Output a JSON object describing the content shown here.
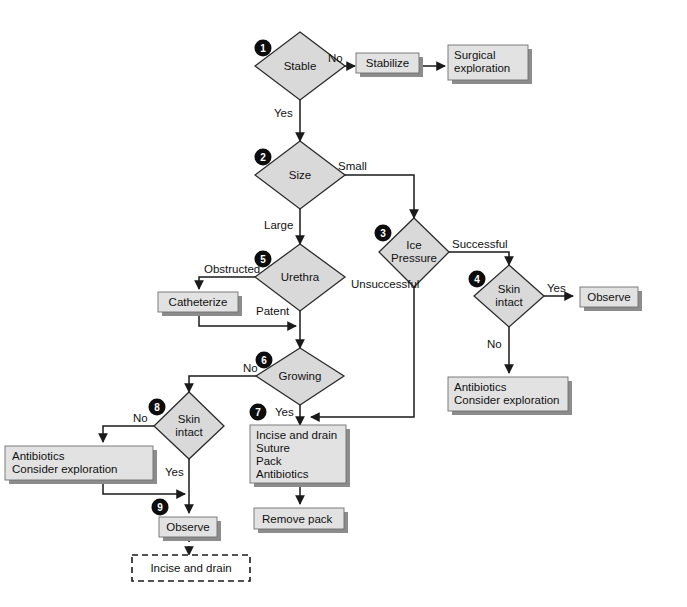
{
  "diagram": {
    "type": "flowchart",
    "palette": {
      "diamond_fill": "#d9d9d9",
      "box_fill": "#e2e2e2",
      "shadow": "#8c8c8c",
      "stroke": "#1a1a1a",
      "badge_fill": "#0d0d0d",
      "badge_text": "#ffffff",
      "background": "#ffffff"
    },
    "nodes": {
      "d1": {
        "label_line1": "Stable",
        "label_line2": "",
        "step": "1",
        "shape": "diamond"
      },
      "d2": {
        "label_line1": "Size",
        "label_line2": "",
        "step": "2",
        "shape": "diamond"
      },
      "d3": {
        "label_line1": "Ice",
        "label_line2": "Pressure",
        "step": "3",
        "shape": "diamond"
      },
      "d4": {
        "label_line1": "Skin",
        "label_line2": "intact",
        "step": "4",
        "shape": "diamond"
      },
      "d5": {
        "label_line1": "Urethra",
        "label_line2": "",
        "step": "5",
        "shape": "diamond"
      },
      "d6": {
        "label_line1": "Growing",
        "label_line2": "",
        "step": "6",
        "shape": "diamond"
      },
      "d8": {
        "label_line1": "Skin",
        "label_line2": "intact",
        "step": "8",
        "shape": "diamond"
      },
      "b_stabilize": {
        "label_line1": "Stabilize",
        "shape": "box"
      },
      "b_surgical": {
        "label_line1": "Surgical",
        "label_line2": "exploration",
        "shape": "box"
      },
      "b_observe_right": {
        "label_line1": "Observe",
        "shape": "box"
      },
      "b_antibiotics_right": {
        "label_line1": "Antibiotics",
        "label_line2": "Consider exploration",
        "shape": "box"
      },
      "b_catheterize": {
        "label_line1": "Catheterize",
        "shape": "box"
      },
      "b_antibiotics_left": {
        "label_line1": "Antibiotics",
        "label_line2": "Consider exploration",
        "shape": "box"
      },
      "b_incise_suture": {
        "label_line1": "Incise and drain",
        "label_line2": "Suture",
        "label_line3": "Pack",
        "label_line4": "Antibiotics",
        "step": "7",
        "shape": "box"
      },
      "b_remove_pack": {
        "label_line1": "Remove pack",
        "shape": "box"
      },
      "b_observe_bottom": {
        "label_line1": "Observe",
        "step": "9",
        "shape": "box"
      },
      "b_incise_dashed": {
        "label_line1": "Incise and drain",
        "shape": "dashed-box"
      }
    },
    "edge_labels": {
      "e_no_1": "No",
      "e_yes_1": "Yes",
      "e_small": "Small",
      "e_large": "Large",
      "e_successful": "Successful",
      "e_unsuccessful": "Unsuccessful",
      "e_yes_4": "Yes",
      "e_no_4": "No",
      "e_obstructed": "Obstructed",
      "e_patent": "Patent",
      "e_no_6": "No",
      "e_yes_6": "Yes",
      "e_no_8": "No",
      "e_yes_8": "Yes"
    }
  }
}
